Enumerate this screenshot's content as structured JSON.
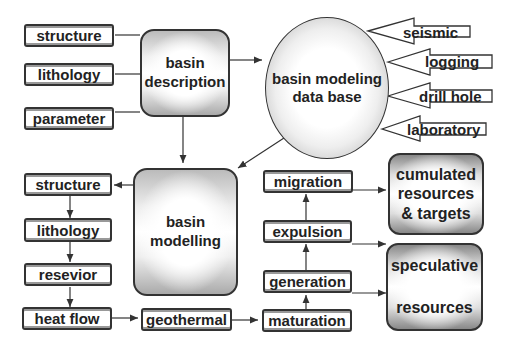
{
  "diagram": {
    "description_inputs": [
      "structure",
      "lithology",
      "parameter"
    ],
    "basin_description": "basin description",
    "database": "basin modeling data base",
    "data_sources": [
      "seismic",
      "logging",
      "drill hole",
      "laboratory"
    ],
    "modelling_steps": [
      "structure",
      "lithology",
      "resevior",
      "heat flow"
    ],
    "basin_modelling": "basin modelling",
    "geothermal": "geothermal",
    "petroleum_steps": [
      "maturation",
      "generation",
      "expulsion",
      "migration"
    ],
    "outputs": {
      "cumulated": "cumulated resources & targets",
      "speculative_top": "speculative",
      "speculative_bottom": "resources"
    }
  }
}
